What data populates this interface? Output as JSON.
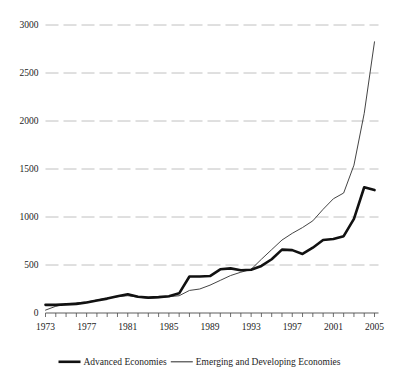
{
  "chart_data": {
    "type": "line",
    "title": "",
    "subtitle": "",
    "xlabel": "",
    "ylabel": "",
    "xlim": [
      1973,
      2005
    ],
    "ylim": [
      0,
      3000
    ],
    "grid": true,
    "legend_position": "bottom",
    "yticks": [
      0,
      500,
      1000,
      1500,
      2000,
      2500,
      3000
    ],
    "ytick_labels": [
      "0",
      "500",
      "1000",
      "1500",
      "2000",
      "2500",
      "3000"
    ],
    "xticks": [
      1973,
      1977,
      1981,
      1985,
      1989,
      1993,
      1997,
      2001,
      2005
    ],
    "xtick_labels": [
      "1973",
      "1977",
      "1981",
      "1985",
      "1989",
      "1993",
      "1997",
      "2001",
      "2005"
    ],
    "x": [
      1973,
      1974,
      1975,
      1976,
      1977,
      1978,
      1979,
      1980,
      1981,
      1982,
      1983,
      1984,
      1985,
      1986,
      1987,
      1988,
      1989,
      1990,
      1991,
      1992,
      1993,
      1994,
      1995,
      1996,
      1997,
      1998,
      1999,
      2000,
      2001,
      2002,
      2003,
      2004,
      2005
    ],
    "series": [
      {
        "name": "Advanced Economies",
        "style": "thick",
        "color": "#111111",
        "values": [
          85,
          85,
          90,
          95,
          110,
          130,
          150,
          175,
          195,
          170,
          160,
          165,
          175,
          205,
          380,
          380,
          385,
          455,
          465,
          445,
          450,
          490,
          560,
          660,
          655,
          615,
          680,
          760,
          770,
          800,
          980,
          1310,
          1280
        ]
      },
      {
        "name": "Emerging and Developing Economies",
        "style": "thin",
        "color": "#3a3a3a",
        "values": [
          30,
          70,
          95,
          105,
          115,
          135,
          155,
          170,
          180,
          165,
          155,
          160,
          170,
          180,
          235,
          250,
          290,
          340,
          390,
          425,
          455,
          560,
          660,
          760,
          830,
          890,
          960,
          1080,
          1190,
          1250,
          1540,
          2080,
          2825
        ]
      }
    ]
  },
  "legend": {
    "items": [
      {
        "label": "Advanced Economies"
      },
      {
        "label": "Emerging and Developing Economies"
      }
    ]
  },
  "colors": {
    "background": "#ffffff",
    "gridline": "#b9b9b9",
    "axis": "#4a4a4a",
    "advanced": "#111111",
    "emerging": "#3a3a3a"
  }
}
